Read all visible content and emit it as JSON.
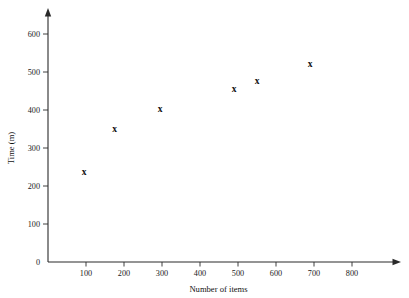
{
  "chart_data": {
    "type": "scatter",
    "title": "",
    "xlabel": "Number of items",
    "ylabel": "Time (m)",
    "xlim": [
      0,
      880
    ],
    "ylim": [
      0,
      660
    ],
    "grid": false,
    "legend": "none",
    "x_ticks": [
      100,
      200,
      300,
      400,
      500,
      600,
      700,
      800
    ],
    "x_tick_labels": [
      "100",
      "200",
      "300",
      "400",
      "500",
      "600",
      "700",
      "800"
    ],
    "y_ticks": [
      0,
      100,
      200,
      300,
      400,
      500,
      600
    ],
    "y_tick_labels": [
      "0",
      "100",
      "200",
      "300",
      "400",
      "500",
      "600"
    ],
    "marker": "x",
    "marker_color": "#111111",
    "axis_color": "#2a2a2a",
    "background_color": "#ffffff",
    "points": [
      {
        "x": 95,
        "y": 238,
        "label": "x"
      },
      {
        "x": 175,
        "y": 350,
        "label": "x"
      },
      {
        "x": 295,
        "y": 403,
        "label": "x"
      },
      {
        "x": 490,
        "y": 455,
        "label": "x"
      },
      {
        "x": 550,
        "y": 477,
        "label": "x"
      },
      {
        "x": 690,
        "y": 520,
        "label": "x"
      }
    ]
  }
}
